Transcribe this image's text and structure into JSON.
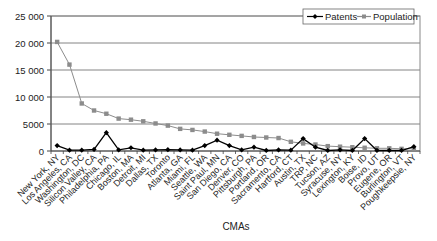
{
  "chart_data": {
    "type": "line",
    "title": "",
    "xlabel": "CMAs",
    "ylabel": "",
    "ylim": [
      0,
      25000
    ],
    "yticks": [
      0,
      5000,
      10000,
      15000,
      20000,
      25000
    ],
    "ytick_labels": [
      "0",
      "5000",
      "10 000",
      "15 000",
      "20 000",
      "25 000"
    ],
    "grid": true,
    "legend_position": "top-right",
    "categories": [
      "New York, NY",
      "Los Angeles, CA",
      "Washington, DC",
      "Silicon Valley, CA",
      "Philadelphia, PA",
      "Chicago, IL",
      "Boston, MA",
      "Detroit, MI",
      "Dallas, TX",
      "Toronto",
      "Atlanta, GA",
      "Miami, FL",
      "Seattle, WA",
      "Saint Paul, MN",
      "San Diego, CA",
      "Denver, CO",
      "Pittsburgh, PA",
      "Portland, OR",
      "Sacramento, CA",
      "Hartford, CT",
      "Austin, TX",
      "TRP, NC",
      "Tucson, AZ",
      "Syracuse, NY",
      "Lexington, KY",
      "Boise, ID",
      "Provo, UT",
      "Eugene, OR",
      "Burlington, VT",
      "Poughkeepsie, NY"
    ],
    "series": [
      {
        "name": "Patents",
        "color": "#000000",
        "marker": "diamond",
        "values": [
          1000,
          150,
          150,
          300,
          3400,
          200,
          600,
          150,
          200,
          250,
          200,
          150,
          1000,
          2000,
          1000,
          200,
          700,
          100,
          200,
          150,
          2300,
          700,
          100,
          200,
          100,
          2300,
          100,
          100,
          100,
          800
        ]
      },
      {
        "name": "Population",
        "color": "#8c8c8c",
        "marker": "square",
        "values": [
          20200,
          16000,
          8800,
          7500,
          6900,
          6000,
          5800,
          5500,
          5100,
          4700,
          4100,
          3900,
          3600,
          3200,
          3000,
          2800,
          2600,
          2500,
          2400,
          1700,
          1400,
          1200,
          900,
          800,
          700,
          600,
          500,
          500,
          400,
          400
        ]
      }
    ]
  }
}
